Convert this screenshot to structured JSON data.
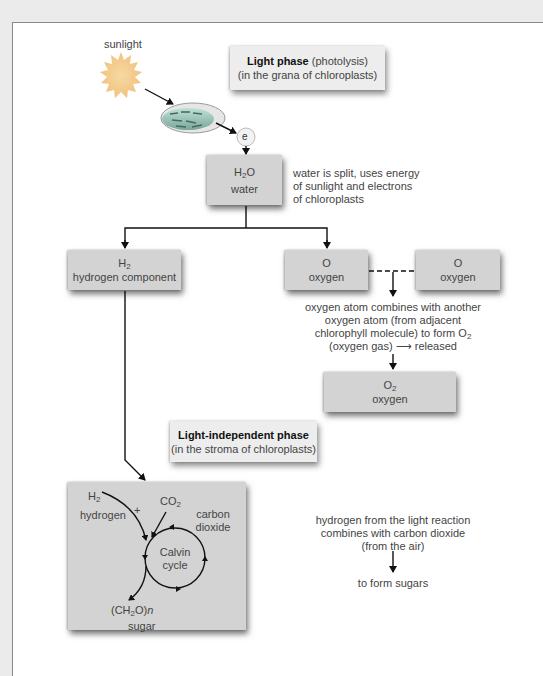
{
  "diagram": {
    "sunlight_label": "sunlight",
    "electron_label": "e",
    "light_phase": {
      "title": "Light phase",
      "title_suffix": " (photolysis)",
      "subtitle": "(in the grana of chloroplasts)"
    },
    "water": {
      "formula_main": "H",
      "formula_sub": "2",
      "formula_end": "O",
      "name": "water",
      "note_lines": [
        "water is split, uses energy",
        "of sunlight and electrons",
        "of chloroplasts"
      ]
    },
    "hydrogen": {
      "formula_main": "H",
      "formula_sub": "2",
      "name": "hydrogen component"
    },
    "oxygen_atom_1": {
      "formula": "O",
      "name": "oxygen"
    },
    "oxygen_atom_2": {
      "formula": "O",
      "name": "oxygen"
    },
    "oxygen_note": {
      "line1": "oxygen atom combines with another",
      "line2": "oxygen atom (from adjacent",
      "line3_prefix": "chlorophyll molecule) to form O",
      "line3_sub": "2",
      "line4": "(oxygen gas) ⟶ released"
    },
    "oxygen_gas": {
      "formula_main": "O",
      "formula_sub": "2",
      "name": "oxygen"
    },
    "light_independent_phase": {
      "title": "Light-independent phase",
      "subtitle": "(in the stroma of chloroplasts)"
    },
    "calvin": {
      "h2_main": "H",
      "h2_sub": "2",
      "hydrogen_label": "hydrogen",
      "plus": "+",
      "co2_main": "CO",
      "co2_sub": "2",
      "co2_label": "carbon dioxide",
      "cycle_line1": "Calvin",
      "cycle_line2": "cycle",
      "sugar_formula_a": "(CH",
      "sugar_formula_sub": "2",
      "sugar_formula_b": "O)",
      "sugar_formula_n": "n",
      "sugar_label": "sugar"
    },
    "sugar_note": {
      "line1": "hydrogen from the light reaction",
      "line2": "combines with carbon dioxide",
      "line3": "(from the air)",
      "result": "to form sugars"
    },
    "colors": {
      "background": "#ebebeb",
      "panel": "#ffffff",
      "box_fill": "#d3d3d3",
      "box_fill_light": "#ededed",
      "arrow": "#111111",
      "sun": "#f2c98a"
    }
  }
}
